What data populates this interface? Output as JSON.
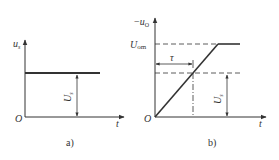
{
  "figure": {
    "panels": [
      {
        "id": "a",
        "caption": "a)",
        "y_axis_label_main": "u",
        "y_axis_label_sub": "s",
        "x_axis_label": "t",
        "origin_label": "O",
        "level_label_main": "U",
        "level_label_sub": "s",
        "description": "Step input voltage u_s of constant amplitude U_s"
      },
      {
        "id": "b",
        "caption": "b)",
        "y_axis_label_prefix": "−",
        "y_axis_label_main": "u",
        "y_axis_label_sub": "O",
        "x_axis_label": "t",
        "origin_label": "O",
        "saturation_label_main": "U",
        "saturation_label_sub": "om",
        "time_constant_label": "τ",
        "level_label_main": "U",
        "level_label_sub": "s",
        "description": "Integrator output −u_O ramps linearly and saturates at U_om; reaches U_s at t = τ"
      }
    ],
    "colors": {
      "line": "#333333",
      "background": "#ffffff"
    }
  }
}
